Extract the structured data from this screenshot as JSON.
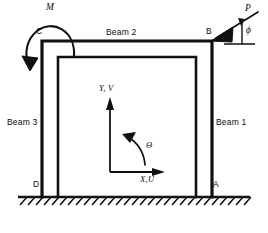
{
  "diagram": {
    "type": "structural-portal-frame-free-body-diagram",
    "stroke_color": "#111111",
    "background": "#ffffff",
    "members": [
      {
        "id": "beam1",
        "label": "Beam 1",
        "role": "right-column"
      },
      {
        "id": "beam2",
        "label": "Beam 2",
        "role": "top-beam"
      },
      {
        "id": "beam3",
        "label": "Beam 3",
        "role": "left-column"
      }
    ],
    "nodes": [
      {
        "id": "nodeC",
        "label": "C",
        "position": "top-left"
      },
      {
        "id": "nodeB",
        "label": "B",
        "position": "top-right"
      },
      {
        "id": "nodeA",
        "label": "A",
        "position": "bottom-right-support"
      },
      {
        "id": "nodeD",
        "label": "D",
        "position": "bottom-left-support"
      }
    ],
    "loads": [
      {
        "id": "moment",
        "label": "M",
        "kind": "applied-moment",
        "sense": "counterclockwise",
        "at": "C"
      },
      {
        "id": "force",
        "label": "P",
        "kind": "point-force",
        "at": "B",
        "direction": "down-left"
      },
      {
        "id": "force_angle",
        "label": "ϕ",
        "kind": "angle-from-horizontal",
        "of": "P"
      }
    ],
    "axes": {
      "vertical_label": "Y, V",
      "horizontal_label": "X,U",
      "rotation_label": "Θ"
    },
    "supports": {
      "kind": "fixed-ground-hatching",
      "at": [
        "A",
        "D"
      ]
    }
  }
}
